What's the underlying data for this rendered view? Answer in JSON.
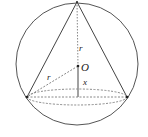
{
  "diagram": {
    "type": "geometry",
    "labels": {
      "center": "O",
      "radius_upper": "r",
      "radius_slant": "r",
      "height_offset": "x"
    },
    "colors": {
      "stroke": "#444444",
      "dashed": "#888888",
      "background": "#ffffff"
    },
    "geometry": {
      "sphere": {
        "cx": 77,
        "cy": 64,
        "r": 61
      },
      "apex": {
        "x": 77,
        "y": 2
      },
      "center_O": {
        "x": 78,
        "y": 66
      },
      "base_left": {
        "x": 27,
        "y": 97
      },
      "base_right": {
        "x": 127,
        "y": 97
      },
      "base_center": {
        "x": 78,
        "y": 97
      },
      "base_ellipse_ry": 8
    }
  }
}
